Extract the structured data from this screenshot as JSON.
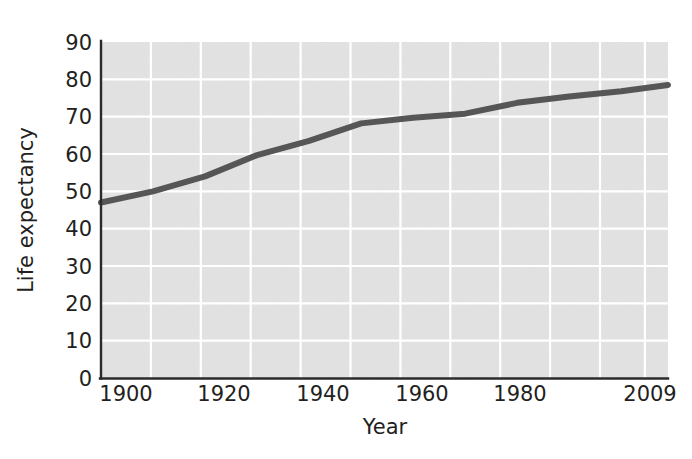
{
  "figure": {
    "background_color": "#ffffff",
    "plot_background_color": "#e3e3e3",
    "gridline_color": "#ffffff",
    "axis_color": "#2b2b2b",
    "series_color": "#565656"
  },
  "axes": {
    "x_title": "Year",
    "y_title": "Life expectancy",
    "x_tick_labels": [
      "1900",
      "1920",
      "1940",
      "1960",
      "1980",
      "2009"
    ],
    "y_tick_labels": [
      "0",
      "10",
      "20",
      "30",
      "40",
      "50",
      "60",
      "70",
      "80",
      "90"
    ]
  },
  "chart_data": {
    "type": "line",
    "title": "",
    "subtitle": "",
    "xlabel": "Year",
    "ylabel": "Life expectancy",
    "xlim": [
      1900,
      2009
    ],
    "ylim": [
      0,
      90
    ],
    "x_ticks": [
      1900,
      1920,
      1940,
      1960,
      1980,
      2009
    ],
    "y_ticks": [
      0,
      10,
      20,
      30,
      40,
      50,
      60,
      70,
      80,
      90
    ],
    "x_minor_gridline_step": 10,
    "y_gridline_step": 10,
    "grid": true,
    "legend": false,
    "legend_position": "none",
    "annotations": [],
    "series": [
      {
        "name": "Life expectancy",
        "color": "#565656",
        "x": [
          1900,
          1910,
          1920,
          1930,
          1940,
          1950,
          1960,
          1970,
          1980,
          1990,
          2000,
          2009
        ],
        "values": [
          47.0,
          50.0,
          54.0,
          59.7,
          63.5,
          68.2,
          69.7,
          70.8,
          73.7,
          75.4,
          76.8,
          78.5
        ]
      }
    ]
  }
}
